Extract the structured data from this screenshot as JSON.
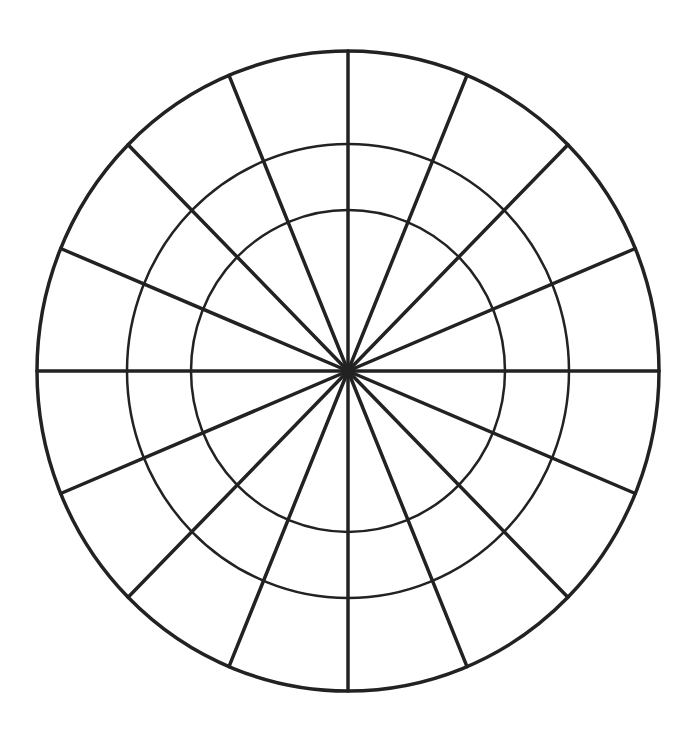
{
  "diagram": {
    "type": "polar-grid-wheel",
    "canvas": {
      "width": 694,
      "height": 732,
      "background": "#ffffff"
    },
    "center": {
      "x": 348,
      "y": 371
    },
    "stroke_color": "#222222",
    "hub": {
      "radius": 6
    },
    "rings": [
      {
        "name": "inner-ring",
        "rx": 157,
        "ry": 161,
        "stroke_width": 2.5
      },
      {
        "name": "middle-ring",
        "rx": 221,
        "ry": 227,
        "stroke_width": 2.5
      },
      {
        "name": "outer-ring",
        "rx": 311,
        "ry": 320,
        "stroke_width": 3.5
      }
    ],
    "spokes": {
      "count": 16,
      "start_angle_deg": 0,
      "stroke_width": 3.5
    },
    "segments_per_ring": 16,
    "ring_bands": 4
  }
}
